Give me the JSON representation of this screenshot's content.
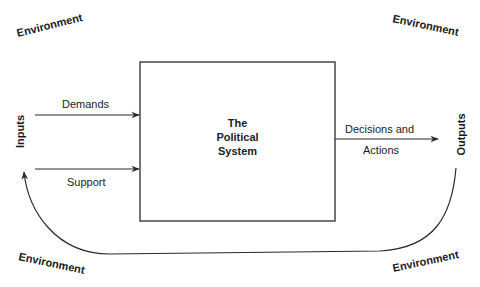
{
  "diagram": {
    "title": "The Political System",
    "system_box": {
      "lines": [
        "The",
        "Political",
        "System"
      ]
    },
    "inputs": {
      "label": "Inputs",
      "flows": [
        {
          "label": "Demands"
        },
        {
          "label": "Support"
        }
      ]
    },
    "outputs": {
      "label": "Outputs",
      "flows": [
        {
          "label_line1": "Decisions and",
          "label_line2": "Actions"
        }
      ]
    },
    "environment": {
      "labels": [
        "Environment",
        "Environment",
        "Environment",
        "Environment"
      ]
    },
    "feedback_loop": {
      "from": "Outputs",
      "to": "Inputs"
    },
    "colors": {
      "line": "#2a2a2a",
      "text": "#1a1a1a",
      "background": "#ffffff"
    }
  }
}
